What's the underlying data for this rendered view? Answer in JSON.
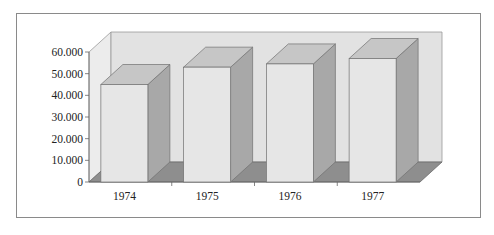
{
  "chart_data": {
    "type": "bar",
    "style": "3d-column",
    "title": "",
    "xlabel": "",
    "ylabel": "",
    "categories": [
      "1974",
      "1975",
      "1976",
      "1977"
    ],
    "values": [
      45000,
      53000,
      54500,
      57000
    ],
    "ylim": [
      0,
      60000
    ],
    "yticks": [
      0,
      10000,
      20000,
      30000,
      40000,
      50000,
      60000
    ],
    "ytick_labels": [
      "0",
      "10.000",
      "20.000",
      "30.000",
      "40.000",
      "50.000",
      "60.000"
    ],
    "grid": false,
    "legend": null
  },
  "colors": {
    "bar_front": "#e6e6e6",
    "bar_side": "#a8a8a8",
    "bar_top": "#c6c6c6",
    "floor": "#8e8e8e",
    "back_wall": "#e2e2e2",
    "side_wall": "#ececec",
    "edge": "#707070",
    "frame": "#8a8a8a"
  }
}
